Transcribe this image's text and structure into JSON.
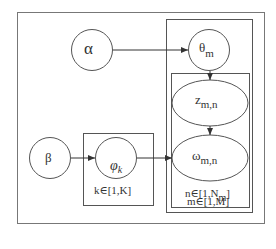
{
  "diagram": {
    "type": "plate-notation graphical model",
    "nodes": {
      "alpha": {
        "symbol": "α"
      },
      "theta": {
        "symbol": "θ",
        "sub": "m"
      },
      "z": {
        "symbol": "z",
        "sub": "m,n"
      },
      "omega": {
        "symbol": "ω",
        "sub": "m,n"
      },
      "beta": {
        "symbol": "β"
      },
      "phi": {
        "symbol": "φ",
        "sub": "k"
      }
    },
    "plates": {
      "k": {
        "label": "k∈[1,K]"
      },
      "n": {
        "label_pre": "n∈[1,N",
        "label_sub": "m",
        "label_post": "]"
      },
      "m": {
        "label": "m∈[1,M]"
      }
    },
    "edges": [
      {
        "from": "alpha",
        "to": "theta"
      },
      {
        "from": "theta",
        "to": "z"
      },
      {
        "from": "z",
        "to": "omega"
      },
      {
        "from": "beta",
        "to": "phi"
      },
      {
        "from": "phi",
        "to": "omega"
      }
    ],
    "colors": {
      "stroke": "#555555",
      "background": "#ffffff"
    }
  }
}
